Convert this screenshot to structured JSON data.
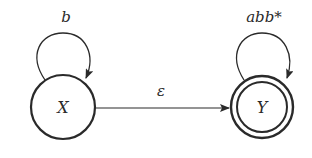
{
  "diagram": {
    "type": "finite-automaton",
    "states": [
      {
        "id": "X",
        "label": "X",
        "accepting": false,
        "self_loop_label": "b"
      },
      {
        "id": "Y",
        "label": "Y",
        "accepting": true,
        "self_loop_label": "abb*"
      }
    ],
    "transitions": [
      {
        "from": "X",
        "to": "Y",
        "label": "ε"
      },
      {
        "from": "X",
        "to": "X",
        "label": "b"
      },
      {
        "from": "Y",
        "to": "Y",
        "label": "abb*"
      }
    ],
    "colors": {
      "stroke": "#2a2a2a",
      "background": "#ffffff"
    }
  }
}
